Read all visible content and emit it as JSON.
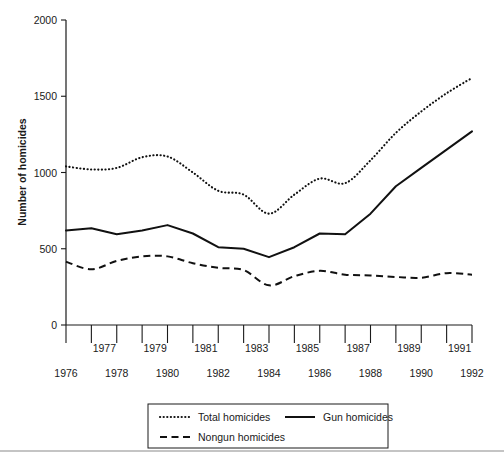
{
  "chart_data": {
    "type": "line",
    "title": "",
    "xlabel": "",
    "ylabel": "Number of homicides",
    "x": [
      1976,
      1977,
      1978,
      1979,
      1980,
      1981,
      1982,
      1983,
      1984,
      1985,
      1986,
      1987,
      1988,
      1989,
      1990,
      1991,
      1992
    ],
    "xlim": [
      1976,
      1992
    ],
    "ylim": [
      0,
      2000
    ],
    "yticks": [
      0,
      500,
      1000,
      1500,
      2000
    ],
    "ytick_labels": [
      "0",
      "500",
      "1000",
      "1500",
      "2000"
    ],
    "xtick_labels_upper": [
      "1977",
      "1979",
      "1981",
      "1983",
      "1985",
      "1987",
      "1989",
      "1991"
    ],
    "xtick_labels_lower": [
      "1976",
      "1978",
      "1980",
      "1982",
      "1984",
      "1986",
      "1988",
      "1990",
      "1992"
    ],
    "grid": false,
    "legend_position": "bottom-center",
    "series": [
      {
        "name": "Total homicides",
        "style": "dotted",
        "values": [
          1040,
          1020,
          1030,
          1100,
          1105,
          1000,
          880,
          855,
          730,
          855,
          960,
          930,
          1080,
          1260,
          1400,
          1520,
          1620
        ]
      },
      {
        "name": "Gun homicides",
        "style": "solid",
        "values": [
          620,
          635,
          595,
          620,
          655,
          600,
          510,
          500,
          445,
          510,
          600,
          595,
          730,
          910,
          1030,
          1150,
          1270
        ]
      },
      {
        "name": "Nongun homicides",
        "style": "dashed",
        "values": [
          415,
          365,
          420,
          450,
          450,
          405,
          375,
          360,
          260,
          320,
          355,
          330,
          325,
          315,
          310,
          340,
          330
        ]
      }
    ]
  },
  "legend": {
    "entries": [
      {
        "label": "Total homicides",
        "style": "dotted"
      },
      {
        "label": "Gun homicides",
        "style": "solid"
      },
      {
        "label": "Nongun homicides",
        "style": "dashed"
      }
    ]
  }
}
